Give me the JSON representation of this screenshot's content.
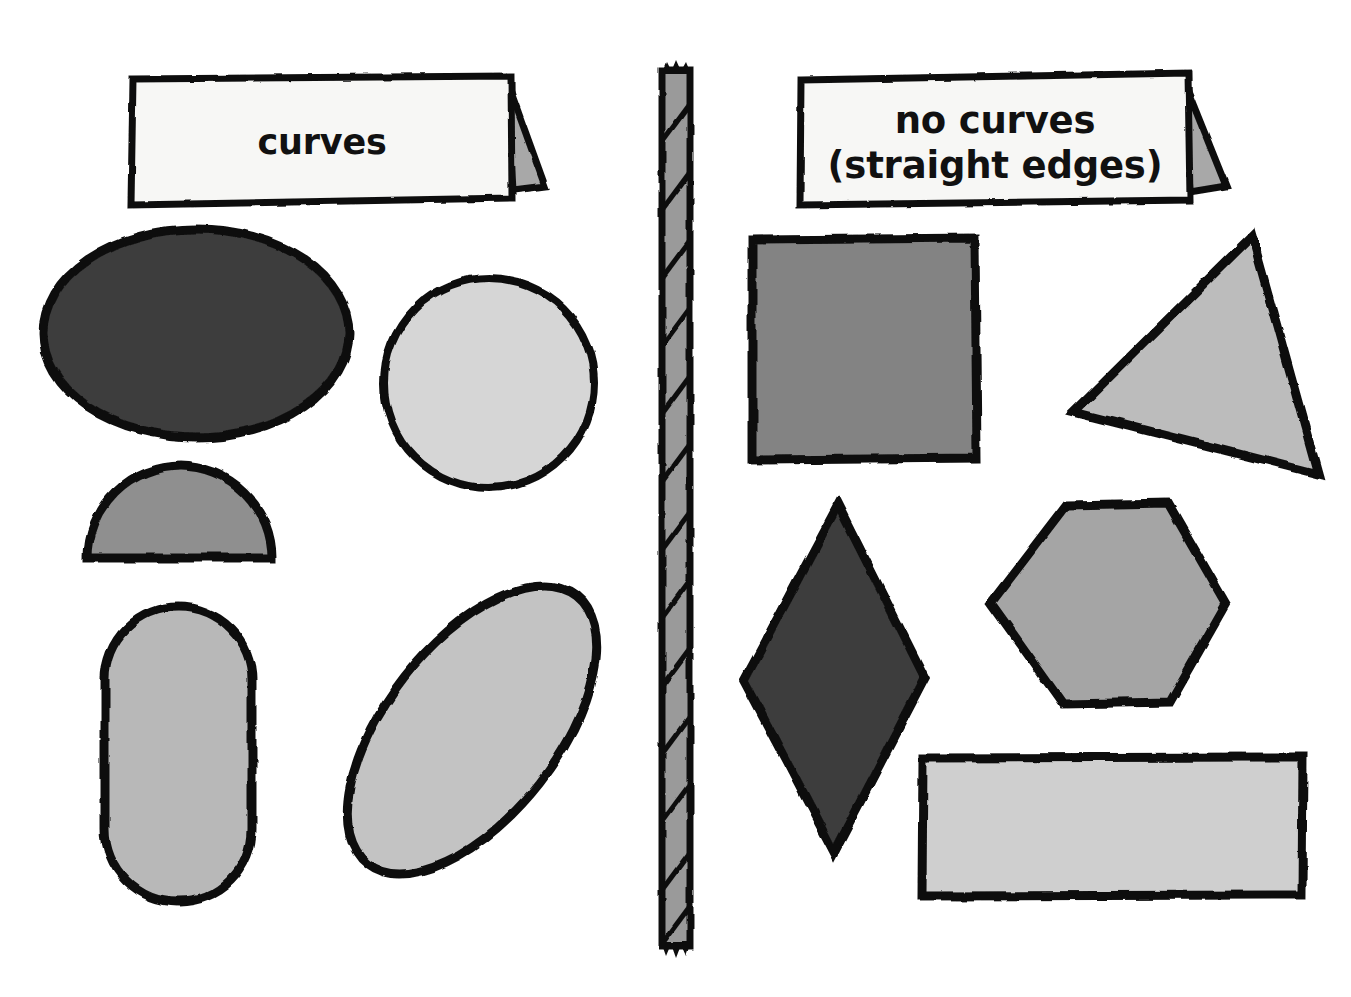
{
  "poster": {
    "width": 1351,
    "height": 997,
    "background_color": "#ffffff",
    "ink_color": "#111111",
    "title_note": "two-column shape sorting chart divided by a rope"
  },
  "columns": [
    {
      "id": "left",
      "heading_card": {
        "name": "curves-heading-card",
        "lines": [
          "curves"
        ],
        "card_fill": "#f7f7f5",
        "flap_fill": "#a8a8a8"
      },
      "shapes": [
        {
          "name": "ellipse",
          "label": "ellipse",
          "fill": "#3c3c3c"
        },
        {
          "name": "circle",
          "label": "circle",
          "fill": "#d6d6d6"
        },
        {
          "name": "semicircle",
          "label": "semicircle",
          "fill": "#8f8f8f"
        },
        {
          "name": "stadium",
          "label": "rounded pill",
          "fill": "#b8b8b8"
        },
        {
          "name": "oval-tilted",
          "label": "tilted oval",
          "fill": "#c3c3c3"
        }
      ]
    },
    {
      "id": "right",
      "heading_card": {
        "name": "no-curves-heading-card",
        "lines": [
          "no curves",
          "(straight edges)"
        ],
        "card_fill": "#f7f7f5",
        "flap_fill": "#a8a8a8"
      },
      "shapes": [
        {
          "name": "square",
          "label": "square",
          "fill": "#838383"
        },
        {
          "name": "triangle",
          "label": "triangle",
          "fill": "#bcbcbc"
        },
        {
          "name": "rhombus",
          "label": "diamond",
          "fill": "#3d3d3d"
        },
        {
          "name": "hexagon",
          "label": "hexagon",
          "fill": "#a5a5a5"
        },
        {
          "name": "rectangle",
          "label": "rectangle",
          "fill": "#cfcfcf"
        }
      ]
    }
  ],
  "divider": {
    "name": "rope-divider",
    "kind": "rope",
    "fill": "#9a9a9a",
    "stroke": "#111111",
    "twists": 13
  }
}
